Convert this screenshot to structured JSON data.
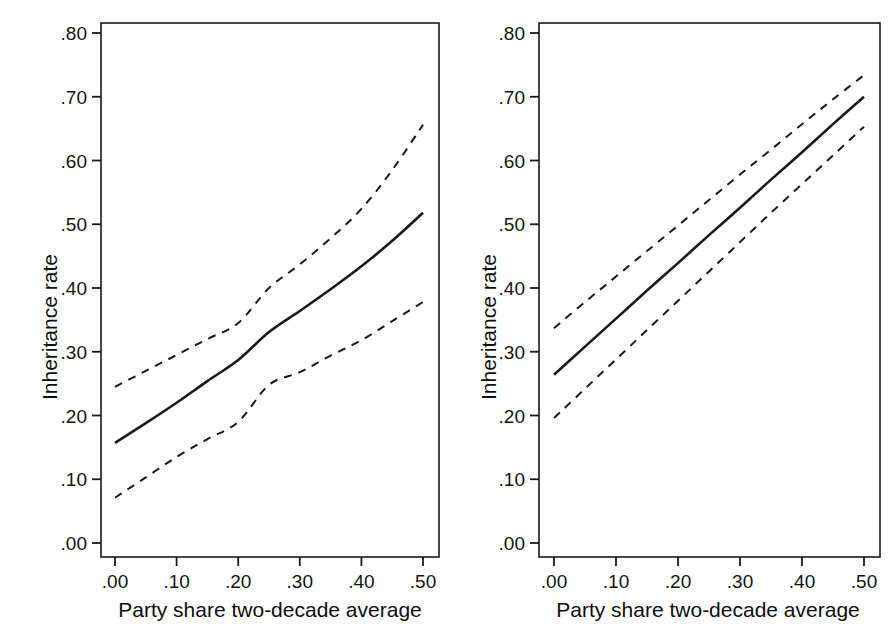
{
  "figure": {
    "background": "#ffffff",
    "line_color": "#1a1a1a",
    "panel_count": 2
  },
  "chart_data": [
    {
      "type": "line",
      "panel": "left",
      "title": "",
      "xlabel": "Party share two-decade average",
      "ylabel": "Inheritance rate",
      "xlim": [
        0.0,
        0.5
      ],
      "ylim": [
        0.0,
        0.82
      ],
      "xticks": [
        0.0,
        0.1,
        0.2,
        0.3,
        0.4,
        0.5
      ],
      "xticklabels": [
        ".00",
        ".10",
        ".20",
        ".30",
        ".40",
        ".50"
      ],
      "yticks": [
        0.0,
        0.1,
        0.2,
        0.3,
        0.4,
        0.5,
        0.6,
        0.7,
        0.8
      ],
      "yticklabels": [
        ".00",
        ".10",
        ".20",
        ".30",
        ".40",
        ".50",
        ".60",
        ".70",
        ".80"
      ],
      "grid": false,
      "legend": "none",
      "x": [
        0.0,
        0.05,
        0.1,
        0.15,
        0.2,
        0.25,
        0.3,
        0.35,
        0.4,
        0.45,
        0.5
      ],
      "series": [
        {
          "name": "Upper 95% CI",
          "style": "dashed",
          "values": [
            0.245,
            0.27,
            0.295,
            0.32,
            0.345,
            0.4,
            0.437,
            0.478,
            0.524,
            0.585,
            0.656
          ]
        },
        {
          "name": "Predicted inheritance rate",
          "style": "solid",
          "values": [
            0.157,
            0.188,
            0.22,
            0.254,
            0.287,
            0.331,
            0.364,
            0.398,
            0.434,
            0.474,
            0.518
          ]
        },
        {
          "name": "Lower 95% CI",
          "style": "dashed",
          "values": [
            0.071,
            0.103,
            0.135,
            0.163,
            0.19,
            0.248,
            0.268,
            0.294,
            0.318,
            0.348,
            0.378
          ]
        }
      ]
    },
    {
      "type": "line",
      "panel": "right",
      "title": "",
      "xlabel": "Party share two-decade average",
      "ylabel": "Inheritance rate",
      "xlim": [
        0.0,
        0.5
      ],
      "ylim": [
        0.0,
        0.82
      ],
      "xticks": [
        0.0,
        0.1,
        0.2,
        0.3,
        0.4,
        0.5
      ],
      "xticklabels": [
        ".00",
        ".10",
        ".20",
        ".30",
        ".40",
        ".50"
      ],
      "yticks": [
        0.0,
        0.1,
        0.2,
        0.3,
        0.4,
        0.5,
        0.6,
        0.7,
        0.8
      ],
      "yticklabels": [
        ".00",
        ".10",
        ".20",
        ".30",
        ".40",
        ".50",
        ".60",
        ".70",
        ".80"
      ],
      "grid": false,
      "legend": "none",
      "x": [
        0.0,
        0.05,
        0.1,
        0.15,
        0.2,
        0.25,
        0.3,
        0.35,
        0.4,
        0.45,
        0.5
      ],
      "series": [
        {
          "name": "Upper 95% CI",
          "style": "dashed",
          "values": [
            0.337,
            0.378,
            0.418,
            0.458,
            0.498,
            0.538,
            0.578,
            0.617,
            0.657,
            0.696,
            0.734
          ]
        },
        {
          "name": "Predicted inheritance rate",
          "style": "solid",
          "values": [
            0.264,
            0.308,
            0.352,
            0.396,
            0.439,
            0.483,
            0.526,
            0.57,
            0.613,
            0.657,
            0.7
          ]
        },
        {
          "name": "Lower 95% CI",
          "style": "dashed",
          "values": [
            0.196,
            0.242,
            0.288,
            0.334,
            0.38,
            0.426,
            0.472,
            0.518,
            0.563,
            0.608,
            0.653
          ]
        }
      ]
    }
  ]
}
